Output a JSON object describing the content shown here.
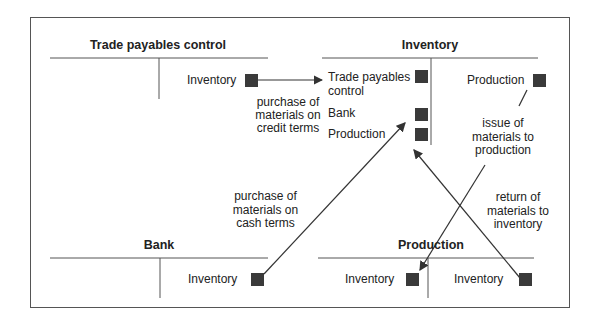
{
  "accounts": {
    "trade_payables": {
      "title": "Trade payables control",
      "credit_entries": [
        "Inventory"
      ]
    },
    "inventory": {
      "title": "Inventory",
      "debit_entries": [
        "Trade payables",
        "control",
        "Bank",
        "Production"
      ],
      "credit_entries": [
        "Production"
      ]
    },
    "bank": {
      "title": "Bank",
      "credit_entries": [
        "Inventory"
      ]
    },
    "production": {
      "title": "Production",
      "debit_entries": [
        "Inventory"
      ],
      "credit_entries": [
        "Inventory"
      ]
    }
  },
  "annotations": {
    "credit_purchase": [
      "purchase of",
      "materials on",
      "credit terms"
    ],
    "cash_purchase": [
      "purchase of",
      "materials on",
      "cash terms"
    ],
    "issue": [
      "issue of",
      "materials to",
      "production"
    ],
    "return": [
      "return of",
      "materials to",
      "inventory"
    ]
  },
  "colors": {
    "line": "#444444",
    "marker": "#3a3a3a"
  }
}
